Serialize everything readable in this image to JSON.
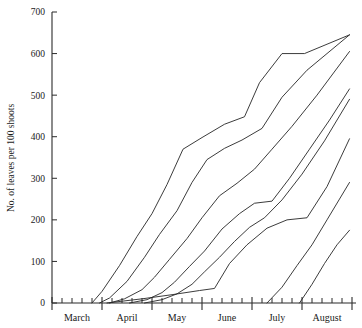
{
  "chart_data": {
    "type": "line",
    "title": "",
    "subtitle": "",
    "xlabel": "",
    "ylabel": "No. of leaves per 100 shoots",
    "ylim": [
      0,
      700
    ],
    "yticks": [
      0,
      100,
      200,
      300,
      400,
      500,
      600,
      700
    ],
    "ytick_labels": [
      "0",
      "100",
      "200",
      "300",
      "400",
      "500",
      "600",
      "700"
    ],
    "grid": false,
    "legend": "none",
    "x_unit": "month",
    "x_axis_note": "Minor ticks are weekly; major ticks separate months",
    "categories": [
      "March",
      "April",
      "May",
      "June",
      "July",
      "August"
    ],
    "xtick_labels": [
      "March",
      "April",
      "May",
      "June",
      "July",
      "August"
    ],
    "xlim": [
      0,
      6
    ],
    "series": [
      {
        "name": "Curve 1",
        "x": [
          0.8,
          1.0,
          1.35,
          1.7,
          2.0,
          2.3,
          2.62,
          3.0,
          3.45,
          3.85,
          4.15,
          4.6,
          5.05,
          5.95
        ],
        "values": [
          0,
          28,
          90,
          160,
          215,
          285,
          370,
          398,
          430,
          448,
          530,
          600,
          600,
          645
        ]
      },
      {
        "name": "Curve 2",
        "x": [
          0.95,
          1.15,
          1.5,
          1.85,
          2.15,
          2.5,
          2.8,
          3.1,
          3.45,
          3.8,
          4.2,
          4.6,
          5.1,
          5.95
        ],
        "values": [
          0,
          12,
          52,
          110,
          165,
          222,
          290,
          345,
          372,
          392,
          420,
          495,
          560,
          645
        ]
      },
      {
        "name": "Curve 3",
        "x": [
          1.15,
          1.45,
          1.8,
          2.05,
          2.35,
          2.7,
          3.0,
          3.35,
          3.7,
          4.05,
          4.4,
          4.8,
          5.3,
          5.95
        ],
        "values": [
          0,
          10,
          32,
          62,
          105,
          155,
          205,
          258,
          288,
          322,
          370,
          425,
          500,
          605
        ]
      },
      {
        "name": "Curve 4",
        "x": [
          1.55,
          1.9,
          2.2,
          2.45,
          2.75,
          3.05,
          3.4,
          3.75,
          4.05,
          4.4,
          4.75,
          5.15,
          5.55,
          5.95
        ],
        "values": [
          0,
          8,
          25,
          50,
          88,
          125,
          178,
          215,
          240,
          245,
          300,
          370,
          440,
          515
        ]
      },
      {
        "name": "Curve 5",
        "x": [
          1.85,
          2.2,
          2.5,
          2.8,
          3.05,
          3.35,
          3.65,
          3.95,
          4.25,
          4.6,
          5.0,
          5.45,
          5.95
        ],
        "values": [
          0,
          8,
          22,
          45,
          75,
          110,
          148,
          182,
          205,
          248,
          310,
          390,
          490
        ]
      },
      {
        "name": "Curve 6",
        "x": [
          1.1,
          1.8,
          2.4,
          2.95,
          3.25,
          3.55,
          3.9,
          4.3,
          4.7,
          5.1,
          5.5,
          5.95
        ],
        "values": [
          0,
          10,
          20,
          30,
          35,
          95,
          140,
          180,
          200,
          205,
          280,
          395
        ]
      },
      {
        "name": "Curve 7",
        "x": [
          4.3,
          4.6,
          4.9,
          5.2,
          5.5,
          5.75,
          5.95
        ],
        "values": [
          0,
          38,
          90,
          140,
          200,
          250,
          290
        ]
      },
      {
        "name": "Curve 8",
        "x": [
          4.95,
          5.2,
          5.45,
          5.7,
          5.95
        ],
        "values": [
          0,
          45,
          95,
          140,
          175
        ]
      }
    ]
  },
  "axes": {
    "y_axis_label": "No. of leaves per 100 shoots",
    "y_tick_values": [
      "0",
      "100",
      "200",
      "300",
      "400",
      "500",
      "600",
      "700"
    ],
    "x_month_labels": [
      "March",
      "April",
      "May",
      "June",
      "July",
      "August"
    ]
  }
}
